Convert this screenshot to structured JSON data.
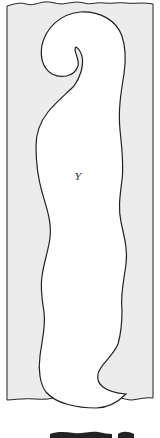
{
  "diagram": {
    "region_label": "Y",
    "colors": {
      "panel_fill": "#ececec",
      "shape_fill": "#ffffff",
      "stroke": "#222222"
    }
  }
}
